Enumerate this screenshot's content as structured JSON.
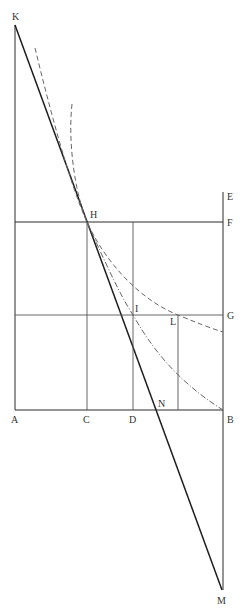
{
  "diagram": {
    "type": "geometric-construction",
    "colors": {
      "line": "#2a2a2a",
      "curve": "#666666",
      "label": "#333333",
      "background": "#ffffff"
    },
    "points": {
      "K": {
        "label": "K",
        "x": 15,
        "y": 25
      },
      "H": {
        "label": "H",
        "x": 87,
        "y": 222
      },
      "E": {
        "label": "E",
        "x": 223,
        "y": 192
      },
      "F": {
        "label": "F",
        "x": 223,
        "y": 222
      },
      "I": {
        "label": "I",
        "x": 133,
        "y": 315
      },
      "L": {
        "label": "L",
        "x": 178,
        "y": 315
      },
      "G": {
        "label": "G",
        "x": 223,
        "y": 315
      },
      "A": {
        "label": "A",
        "x": 15,
        "y": 410
      },
      "C": {
        "label": "C",
        "x": 87,
        "y": 410
      },
      "D": {
        "label": "D",
        "x": 133,
        "y": 410
      },
      "N": {
        "label": "N",
        "x": 157,
        "y": 410
      },
      "B": {
        "label": "B",
        "x": 223,
        "y": 410
      },
      "M": {
        "label": "M",
        "x": 222,
        "y": 590
      }
    },
    "segments": [
      {
        "name": "KA",
        "from": "K",
        "to": "A",
        "style": "solid"
      },
      {
        "name": "KM",
        "from": "K",
        "to": "M",
        "style": "solid"
      },
      {
        "name": "EM",
        "from": "E",
        "to": "M",
        "style": "solid"
      },
      {
        "name": "HF",
        "from": "A-level",
        "to": "F",
        "style": "solid"
      },
      {
        "name": "AG",
        "from": "A-level",
        "to": "G",
        "style": "thin"
      },
      {
        "name": "AB",
        "from": "A",
        "to": "B",
        "style": "solid"
      },
      {
        "name": "HC",
        "from": "H",
        "to": "C",
        "style": "thin"
      },
      {
        "name": "ID",
        "from": "F-level",
        "to": "D",
        "style": "thin"
      },
      {
        "name": "L-vertical",
        "from": "L",
        "to": "B-level",
        "style": "thin"
      }
    ],
    "curves": [
      {
        "name": "dashed-hyperbola",
        "style": "dashed",
        "passes_through": [
          "H",
          "L"
        ],
        "ends_near": "G"
      },
      {
        "name": "dashdot-curve",
        "style": "dash-dot",
        "passes_through": [
          "H",
          "I"
        ],
        "ends_at": "B"
      },
      {
        "name": "steep-dashed-curve",
        "style": "dashed",
        "passes_through": [
          "H"
        ]
      }
    ]
  }
}
